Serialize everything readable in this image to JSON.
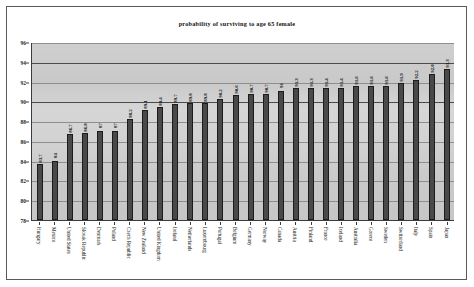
{
  "chart_data": {
    "type": "bar",
    "title": "probability of surviving to age 65 female",
    "xlabel": "",
    "ylabel": "",
    "ylim": [
      78,
      96
    ],
    "yticks": [
      78,
      80,
      82,
      84,
      86,
      88,
      90,
      92,
      94,
      96
    ],
    "grid": true,
    "legend": "none",
    "categories": [
      "Hungary",
      "Mexico",
      "United States",
      "Slovak Republic",
      "Denmark",
      "Poland",
      "Czech Republic",
      "New Zealand",
      "United Kingdom",
      "Ireland",
      "Netherlands",
      "Luxembourg",
      "Portugal",
      "Belgium",
      "Germany",
      "Norway",
      "Canada",
      "Austria",
      "Finland",
      "France",
      "Iceland",
      "Australia",
      "Greece",
      "Sweden",
      "Switzerland",
      "Italy",
      "Spain",
      "Japan"
    ],
    "values": [
      83.7,
      84,
      86.7,
      86.8,
      87,
      87,
      88.2,
      89.1,
      89.4,
      89.7,
      89.8,
      89.8,
      90.2,
      90.6,
      90.7,
      90.7,
      91,
      91.3,
      91.3,
      91.4,
      91.4,
      91.6,
      91.6,
      91.6,
      91.9,
      92.2,
      92.8,
      93.3
    ],
    "value_labels": [
      "83.7",
      "84",
      "86.7",
      "86.8",
      "87",
      "87",
      "88.2",
      "89.1",
      "89.4",
      "89.7",
      "89.8",
      "89.8",
      "90.2",
      "90.6",
      "90.7",
      "90.7",
      "91",
      "91.3",
      "91.3",
      "91.4",
      "91.4",
      "91.6",
      "91.6",
      "91.6",
      "91.9",
      "92.2",
      "92.8",
      "93.3"
    ],
    "colors": {
      "bar_fill": "#494949",
      "bar_border": "#1c1c1c",
      "plot_background": "#cfcfcf",
      "gridline": "#8e8e8e",
      "axis": "#3b3b3b",
      "page_background": "#ffffff",
      "border": "#5a5a5a",
      "text": "#141414"
    }
  }
}
